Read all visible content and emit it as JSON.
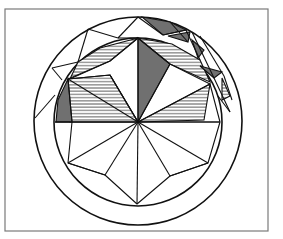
{
  "figure": {
    "caption": "",
    "colors": {
      "line": "#111111",
      "frame": "#7a7a7a",
      "background": "#ffffff"
    },
    "frame": {
      "x": 5,
      "y": 9,
      "width": 263,
      "height": 222
    },
    "center": {
      "x": 138,
      "y": 122
    },
    "outer_circle_radius": 104,
    "inner_circle_radius": 84,
    "table_octagon_vertices": [
      [
        138,
        38
      ],
      [
        193,
        62
      ],
      [
        209,
        84
      ],
      [
        220,
        122
      ],
      [
        208,
        163
      ],
      [
        170,
        176
      ],
      [
        137,
        204
      ],
      [
        105,
        175
      ],
      [
        68,
        163
      ],
      [
        55,
        122
      ],
      [
        68,
        79
      ],
      [
        110,
        61
      ]
    ],
    "spokes": [
      [
        138,
        38
      ],
      [
        170,
        64
      ],
      [
        209,
        84
      ],
      [
        220,
        122
      ],
      [
        208,
        163
      ],
      [
        170,
        176
      ],
      [
        137,
        204
      ],
      [
        105,
        175
      ],
      [
        68,
        163
      ],
      [
        55,
        122
      ],
      [
        68,
        79
      ],
      [
        110,
        61
      ]
    ],
    "shaded_regions": [
      {
        "name": "upper-center-kite",
        "style": "dark"
      },
      {
        "name": "upper-left-band",
        "style": "light"
      },
      {
        "name": "left-kite",
        "style": "light"
      },
      {
        "name": "left-edge-sliver",
        "style": "dark"
      },
      {
        "name": "right-kite",
        "style": "light"
      },
      {
        "name": "upper-right-band",
        "style": "light"
      },
      {
        "name": "top-right-chips",
        "style": "dark"
      }
    ]
  }
}
